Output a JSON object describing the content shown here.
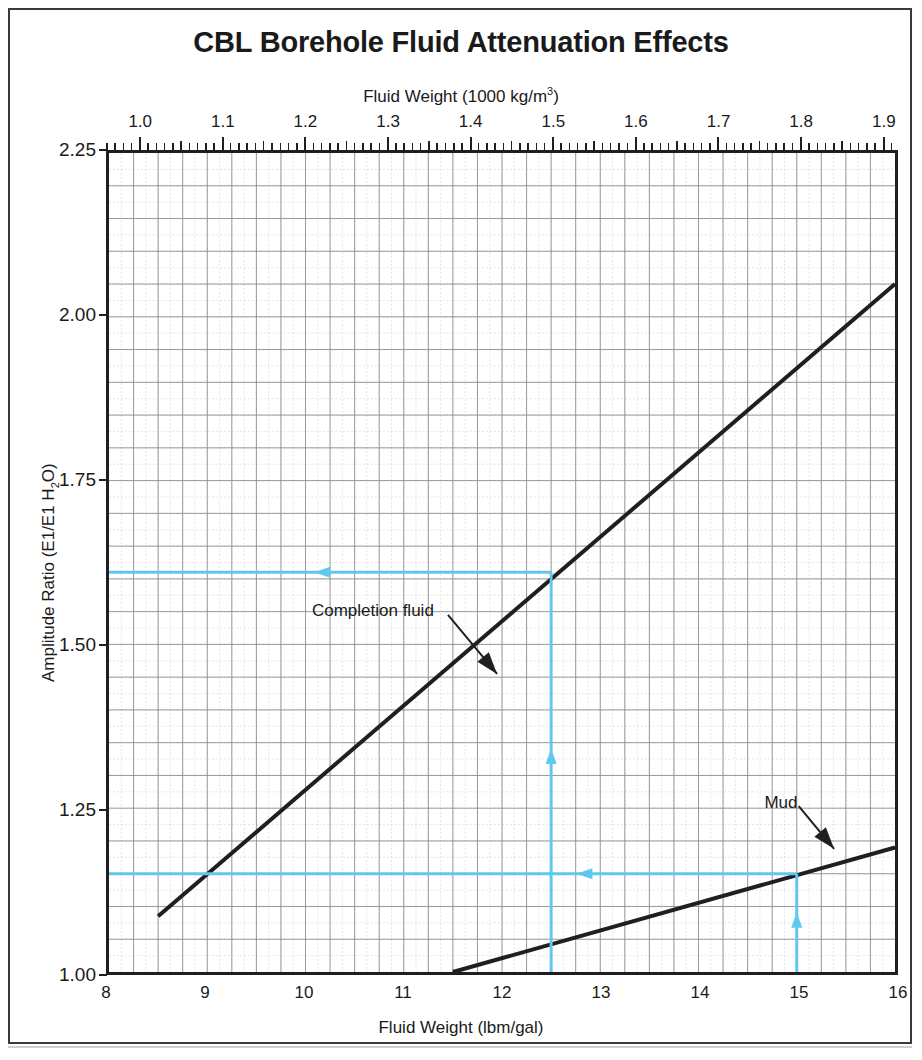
{
  "figure": {
    "title": "CBL Borehole Fluid Attenuation Effects",
    "frame_color": "#3a3a3a"
  },
  "chart_data": {
    "type": "line",
    "title": "CBL Borehole Fluid Attenuation Effects",
    "xlabel": "Fluid Weight (lbm/gal)",
    "ylabel": "Amplitude Ratio (E1/E1 H2O)",
    "ylabel_display": "Amplitude Ratio (E1/E1 H",
    "ylabel_sub": "2",
    "ylabel_tail": "O)",
    "top_axis_label_prefix": "Fluid Weight (1000 kg/m",
    "top_axis_label_sup": "3",
    "top_axis_label_suffix": ")",
    "xlim": [
      8,
      16
    ],
    "ylim": [
      1.0,
      2.25
    ],
    "top_xlim": [
      0.9586,
      1.9172
    ],
    "grid": true,
    "grid_major_x_step": 0.25,
    "grid_major_y_step": 0.05,
    "grid_minor_x_step": 0.125,
    "grid_minor_y_step": 0.025,
    "legend": "none",
    "xticks": [
      8,
      9,
      10,
      11,
      12,
      13,
      14,
      15,
      16
    ],
    "xtick_labels": [
      "8",
      "9",
      "10",
      "11",
      "12",
      "13",
      "14",
      "15",
      "16"
    ],
    "yticks": [
      1.0,
      1.25,
      1.5,
      1.75,
      2.0,
      2.25
    ],
    "ytick_labels": [
      "1.00",
      "1.25",
      "1.50",
      "1.75",
      "2.00",
      "2.25"
    ],
    "top_xticks": [
      1.0,
      1.1,
      1.2,
      1.3,
      1.4,
      1.5,
      1.6,
      1.7,
      1.8,
      1.9
    ],
    "top_xtick_labels": [
      "1.0",
      "1.1",
      "1.2",
      "1.3",
      "1.4",
      "1.5",
      "1.6",
      "1.7",
      "1.8",
      "1.9"
    ],
    "top_minor_tick_step": 0.01,
    "series": [
      {
        "name": "Completion fluid",
        "color": "#1f1f1f",
        "x": [
          8.5,
          16.0
        ],
        "y": [
          1.085,
          2.05
        ]
      },
      {
        "name": "Mud",
        "color": "#1f1f1f",
        "x": [
          11.5,
          16.0
        ],
        "y": [
          1.0,
          1.19
        ]
      }
    ],
    "annotations": [
      {
        "name": "completion-fluid-annotation",
        "text": "Completion fluid",
        "text_x": 10.05,
        "text_y": 1.555,
        "arrow_from_x": 11.45,
        "arrow_from_y": 1.545,
        "arrow_to_x": 11.95,
        "arrow_to_y": 1.455
      },
      {
        "name": "mud-annotation",
        "text": "Mud",
        "text_x": 14.62,
        "text_y": 1.263,
        "arrow_from_x": 15.02,
        "arrow_from_y": 1.253,
        "arrow_to_x": 15.38,
        "arrow_to_y": 1.188
      }
    ],
    "construction_lines": {
      "color": "#5ec8ef",
      "lines": [
        {
          "name": "completion-fluid-vertical",
          "orientation": "vertical",
          "x": 12.5,
          "y_from": 1.0,
          "y_to": 1.61,
          "arrow_at_y": 1.325,
          "arrow_direction": "up"
        },
        {
          "name": "completion-fluid-horizontal",
          "orientation": "horizontal",
          "y": 1.61,
          "x_from": 12.5,
          "x_to": 8.0,
          "arrow_at_x": 10.2,
          "arrow_direction": "left"
        },
        {
          "name": "mud-vertical",
          "orientation": "vertical",
          "x": 15.0,
          "y_from": 1.0,
          "y_to": 1.15,
          "arrow_at_y": 1.075,
          "arrow_direction": "up"
        },
        {
          "name": "mud-horizontal",
          "orientation": "horizontal",
          "y": 1.15,
          "x_from": 15.0,
          "x_to": 8.0,
          "arrow_at_x": 12.87,
          "arrow_direction": "left"
        }
      ]
    }
  }
}
